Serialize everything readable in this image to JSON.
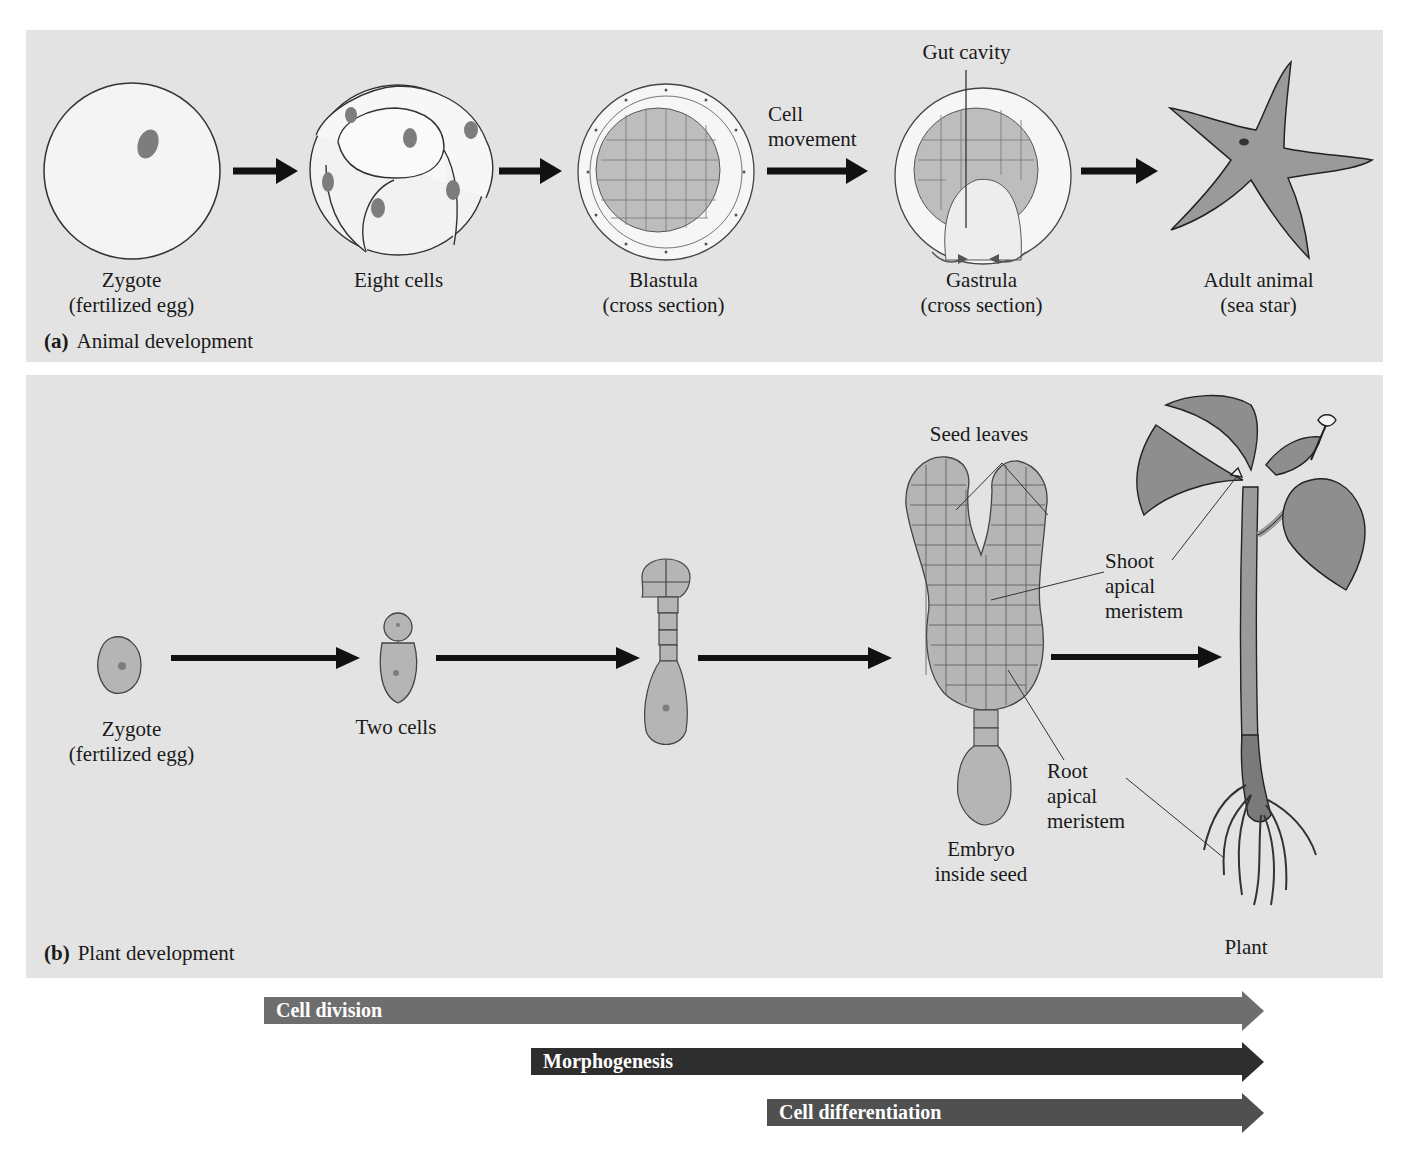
{
  "figure": {
    "panels": [
      {
        "id": "a",
        "letter": "(a)",
        "caption": "Animal development",
        "stages": [
          {
            "name": "Zygote",
            "sub": "(fertilized egg)"
          },
          {
            "name": "Eight cells",
            "sub": ""
          },
          {
            "name": "Blastula",
            "sub": "(cross section)"
          },
          {
            "name": "Gastrula",
            "sub": "(cross section)"
          },
          {
            "name": "Adult animal",
            "sub": "(sea star)"
          }
        ],
        "arrow_labels": {
          "cell_movement_1": "Cell",
          "cell_movement_2": "movement"
        },
        "callouts": {
          "gut_cavity": "Gut cavity"
        }
      },
      {
        "id": "b",
        "letter": "(b)",
        "caption": "Plant development",
        "stages": [
          {
            "name": "Zygote",
            "sub": "(fertilized egg)"
          },
          {
            "name": "Two cells",
            "sub": ""
          },
          {
            "name": "",
            "sub": ""
          },
          {
            "name": "Embryo",
            "sub": "inside seed"
          },
          {
            "name": "Plant",
            "sub": ""
          }
        ],
        "callouts": {
          "seed_leaves": "Seed leaves",
          "shoot_1": "Shoot",
          "shoot_2": "apical",
          "shoot_3": "meristem",
          "root_1": "Root",
          "root_2": "apical",
          "root_3": "meristem"
        }
      }
    ],
    "process_bars": [
      {
        "label": "Cell division",
        "color": "#6e6e6e"
      },
      {
        "label": "Morphogenesis",
        "color": "#2e2e2e"
      },
      {
        "label": "Cell differentiation",
        "color": "#505050"
      }
    ],
    "colors": {
      "panel_bg": "#e3e3e3",
      "cell_fill": "#b5b5b5",
      "nucleus": "#7d7d7d",
      "egg_fill": "#f4f4f4",
      "arrow": "#111111"
    }
  }
}
